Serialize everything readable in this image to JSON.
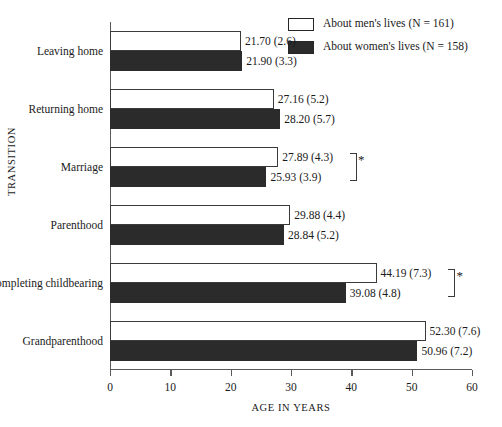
{
  "chart_data": {
    "type": "bar",
    "orientation": "horizontal",
    "title": "",
    "xlabel": "AGE IN YEARS",
    "ylabel": "TRANSITION",
    "xlim": [
      0,
      60
    ],
    "xticks": [
      0,
      10,
      20,
      30,
      40,
      50,
      60
    ],
    "grid": false,
    "legend_position": "top-right",
    "categories": [
      "Leaving home",
      "Returning home",
      "Marriage",
      "Parenthood",
      "Completing childbearing",
      "Grandparenthood"
    ],
    "series": [
      {
        "name": "About men's lives (N = 161)",
        "color": "#ffffff",
        "values": [
          21.7,
          27.16,
          27.89,
          29.88,
          44.19,
          52.3
        ],
        "sd": [
          2.6,
          5.2,
          4.3,
          4.4,
          7.3,
          7.6
        ],
        "labels": [
          "21.70 (2.6)",
          "27.16 (5.2)",
          "27.89 (4.3)",
          "29.88 (4.4)",
          "44.19 (7.3)",
          "52.30 (7.6)"
        ]
      },
      {
        "name": "About women's lives (N = 158)",
        "color": "#2b2b2b",
        "values": [
          21.9,
          28.2,
          25.93,
          28.84,
          39.08,
          50.96
        ],
        "sd": [
          3.3,
          5.7,
          3.9,
          5.2,
          4.8,
          7.2
        ],
        "labels": [
          "21.90 (3.3)",
          "28.20 (5.7)",
          "25.93 (3.9)",
          "28.84 (5.2)",
          "39.08 (4.8)",
          "50.96 (7.2)"
        ]
      }
    ],
    "annotations": [
      {
        "category": "Marriage",
        "symbol": "*"
      },
      {
        "category": "Completing childbearing",
        "symbol": "*"
      }
    ]
  },
  "legend": {
    "items": [
      {
        "label": "About men's lives (N = 161)",
        "swatch": "men"
      },
      {
        "label": "About women's lives (N = 158)",
        "swatch": "women"
      }
    ]
  }
}
